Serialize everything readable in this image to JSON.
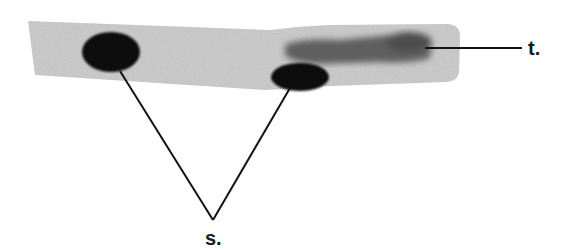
{
  "figure": {
    "labels": {
      "spots": "s.",
      "tail": "t."
    },
    "colors": {
      "strip": "#c8c8c8",
      "spot": "#0d0d0d",
      "tail": "#5a5a5a",
      "line": "#111111"
    }
  }
}
